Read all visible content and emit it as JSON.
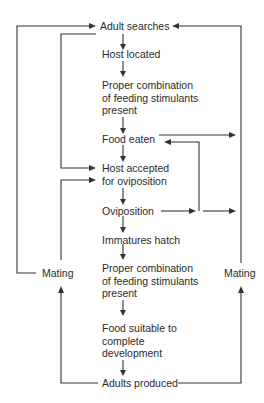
{
  "diagram": {
    "type": "flowchart",
    "title": "",
    "nodes": [
      {
        "id": "adult_searches",
        "label": "Adult searches"
      },
      {
        "id": "host_located",
        "label": "Host located"
      },
      {
        "id": "stimulants_1",
        "lines": [
          "Proper combination",
          "of feeding stimulants",
          "present"
        ]
      },
      {
        "id": "food_eaten",
        "label": "Food eaten"
      },
      {
        "id": "host_accepted",
        "lines": [
          "Host accepted",
          "for oviposition"
        ]
      },
      {
        "id": "oviposition",
        "label": "Oviposition"
      },
      {
        "id": "immatures_hatch",
        "label": "Immatures hatch"
      },
      {
        "id": "stimulants_2",
        "lines": [
          "Proper combination",
          "of feeding stimulants",
          "present"
        ]
      },
      {
        "id": "food_suitable",
        "lines": [
          "Food suitable to",
          "complete",
          "development"
        ]
      },
      {
        "id": "adults_produced",
        "label": "Adults produced"
      },
      {
        "id": "mating_left",
        "label": "Mating"
      },
      {
        "id": "mating_right",
        "label": "Mating"
      }
    ],
    "edges": [
      {
        "from": "adult_searches",
        "to": "host_located"
      },
      {
        "from": "host_located",
        "to": "stimulants_1"
      },
      {
        "from": "stimulants_1",
        "to": "food_eaten"
      },
      {
        "from": "food_eaten",
        "to": "host_accepted"
      },
      {
        "from": "host_accepted",
        "to": "oviposition"
      },
      {
        "from": "oviposition",
        "to": "immatures_hatch"
      },
      {
        "from": "immatures_hatch",
        "to": "stimulants_2"
      },
      {
        "from": "stimulants_2",
        "to": "food_suitable"
      },
      {
        "from": "food_suitable",
        "to": "adults_produced"
      },
      {
        "from": "host_located",
        "to": "host_accepted",
        "note": "bypass loop on left"
      },
      {
        "from": "adults_produced",
        "to": "mating_left"
      },
      {
        "from": "mating_left",
        "to": "host_accepted"
      },
      {
        "from": "mating_left",
        "to": "adult_searches"
      },
      {
        "from": "adults_produced",
        "to": "mating_right"
      },
      {
        "from": "mating_right",
        "to": "adult_searches"
      },
      {
        "from": "food_eaten",
        "to": "mating_right",
        "note": "arrow right to outer line"
      },
      {
        "from": "oviposition",
        "to": "food_eaten",
        "note": "loop back"
      },
      {
        "from": "oviposition",
        "to": "mating_right",
        "note": "arrow right to outer line"
      }
    ]
  }
}
